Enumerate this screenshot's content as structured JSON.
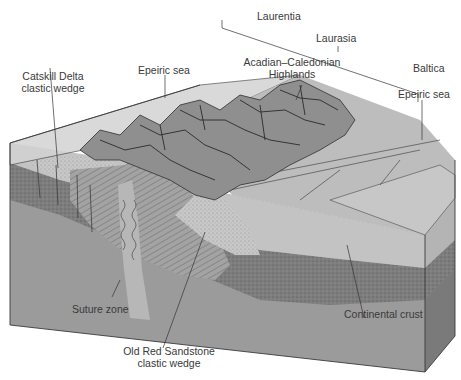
{
  "diagram": {
    "type": "geologic-block-diagram",
    "labels": {
      "laurentia": "Laurentia",
      "laurasia": "Laurasia",
      "baltica": "Baltica",
      "highlands_line1": "Acadian–Caledonian",
      "highlands_line2": "Highlands",
      "epeiric_sea_left": "Epeiric sea",
      "epeiric_sea_right": "Epeiric sea",
      "catskill_line1": "Catskill Delta",
      "catskill_line2": "clastic wedge",
      "suture_zone": "Suture zone",
      "old_red_line1": "Old Red Sandstone",
      "old_red_line2": "clastic wedge",
      "continental_crust": "Continental crust"
    },
    "colors": {
      "sea_surface": "#c9c9c9",
      "top_surface": "#b5b5b5",
      "mountains": "#8e8e8e",
      "sediment_light": "#c4c4c4",
      "sediment_dotted": "#7a7a7a",
      "crust": "#9a9a9a",
      "crust_dark": "#6f6f6f",
      "line": "#2e2e2e",
      "text": "#3a3a3a"
    }
  }
}
